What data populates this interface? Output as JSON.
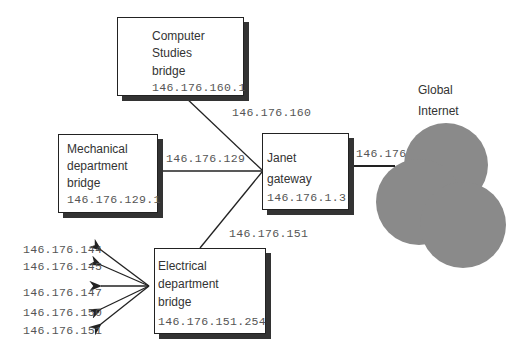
{
  "nodes": {
    "computer_studies": {
      "line1": "Computer",
      "line2": "Studies",
      "line3": "bridge",
      "ip": "146.176.160.1"
    },
    "mechanical": {
      "line1": "Mechanical",
      "line2": "department",
      "line3": "bridge",
      "ip": "146.176.129.1"
    },
    "janet": {
      "line1": "Janet",
      "line2": "gateway",
      "ip": "146.176.1.3"
    },
    "electrical": {
      "line1": "Electrical",
      "line2": "department",
      "line3": "bridge",
      "ip": "146.176.151.254"
    },
    "internet": {
      "line1": "Global",
      "line2": "Internet",
      "color": "#8a8a8a"
    }
  },
  "links": {
    "cs_to_janet": "146.176.160",
    "mech_to_janet": "146.176.129",
    "elec_to_janet": "146.176.151",
    "janet_to_internet": "146.176"
  },
  "subnets": [
    "146.176.144",
    "146.176.145",
    "146.176.147",
    "146.176.150",
    "146.176.151"
  ]
}
